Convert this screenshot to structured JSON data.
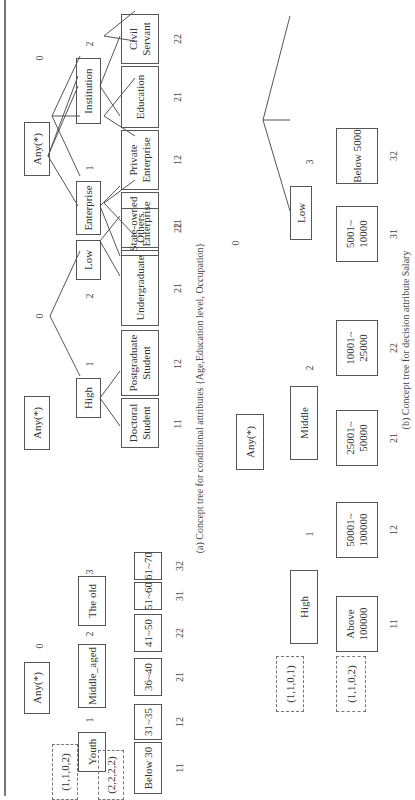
{
  "figure": {
    "caption_a": "(a) Concept tree for conditional attributes {Age,Education level, Occupation}",
    "caption_b": "(b) Concept tree for decision attribute Salary"
  },
  "trees": {
    "age": {
      "root": "Any(*)",
      "root_level": "0",
      "children": [
        {
          "label": "Youth",
          "level": "1",
          "leaves": [
            {
              "label": "Below 30",
              "code": "11"
            },
            {
              "label": "31~35",
              "code": "12"
            }
          ]
        },
        {
          "label": "Middle_aged",
          "level": "2",
          "leaves": [
            {
              "label": "36~40",
              "code": "21"
            },
            {
              "label": "41~50",
              "code": "22"
            }
          ]
        },
        {
          "label": "The old",
          "level": "3",
          "leaves": [
            {
              "label": "51~60",
              "code": "31"
            },
            {
              "label": "61~70",
              "code": "32"
            }
          ]
        }
      ],
      "markers": [
        "(1,1,0,2)",
        "(2,2,2,2)"
      ]
    },
    "education": {
      "root": "Any(*)",
      "root_level": "0",
      "children": [
        {
          "label": "High",
          "level": "1",
          "leaves": [
            {
              "label": "Doctoral Student",
              "code": "11"
            },
            {
              "label": "Postgraduate Student",
              "code": "12"
            }
          ]
        },
        {
          "label": "Low",
          "level": "2",
          "leaves": [
            {
              "label": "Undergraduate",
              "code": "21"
            },
            {
              "label": "Others",
              "code": "22"
            }
          ]
        }
      ]
    },
    "occupation": {
      "root": "Any(*)",
      "root_level": "0",
      "children": [
        {
          "label": "Enterprise",
          "level": "1",
          "leaves": [
            {
              "label": "State-owned Enterprise",
              "code": "11"
            },
            {
              "label": "Private Enterprise",
              "code": "12"
            }
          ]
        },
        {
          "label": "Institution",
          "level": "2",
          "leaves": [
            {
              "label": "Education",
              "code": "21"
            },
            {
              "label": "Civil Servant",
              "code": "22"
            }
          ]
        }
      ]
    },
    "salary": {
      "root": "Any(*)",
      "root_level": "0",
      "children": [
        {
          "label": "High",
          "level": "1",
          "leaves": [
            {
              "label": "Above 100000",
              "code": "11"
            },
            {
              "label": "50001~ 100000",
              "code": "12"
            }
          ]
        },
        {
          "label": "Middle",
          "level": "2",
          "leaves": [
            {
              "label": "25001~ 50000",
              "code": "21"
            },
            {
              "label": "10001~ 25000",
              "code": "22"
            }
          ]
        },
        {
          "label": "Low",
          "level": "3",
          "leaves": [
            {
              "label": "5001~ 10000",
              "code": "31"
            },
            {
              "label": "Below 5000",
              "code": "32"
            }
          ]
        }
      ],
      "markers": [
        "(1,1,0,1)",
        "(1,1,0,2)"
      ]
    }
  }
}
